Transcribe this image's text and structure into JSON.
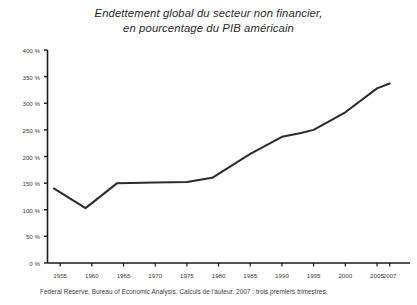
{
  "chart_data": {
    "type": "line",
    "title": "Endettement global du secteur non financier, en pourcentage du PIB américain",
    "title_lines": [
      "Endettement global du secteur non financier,",
      "en pourcentage du PIB américain"
    ],
    "xlabel": "",
    "ylabel": "",
    "xlim": [
      1953,
      2008
    ],
    "ylim": [
      0,
      400
    ],
    "grid": false,
    "legend": false,
    "line_color": "#2b2b2b",
    "axis_color": "#1a1a1a",
    "background_color": "#ffffff",
    "x_tick_labels": [
      "1955",
      "1960",
      "1965",
      "1970",
      "1975",
      "1980",
      "1985",
      "1990",
      "1995",
      "2000",
      "2005",
      "2007"
    ],
    "x_tick_values": [
      1955,
      1960,
      1965,
      1970,
      1975,
      1980,
      1985,
      1990,
      1995,
      2000,
      2005,
      2007
    ],
    "y_tick_labels": [
      "0 %",
      "50 %",
      "100 %",
      "150 %",
      "200 %",
      "250 %",
      "300 %",
      "350 %",
      "400 %"
    ],
    "y_tick_values": [
      0,
      50,
      100,
      150,
      200,
      250,
      300,
      350,
      400
    ],
    "series": [
      {
        "name": "Endettement global du secteur non financier (% du PIB)",
        "x": [
          1954,
          1959,
          1964,
          1970,
          1975,
          1979,
          1985,
          1990,
          1993,
          1995,
          2000,
          2005,
          2007
        ],
        "values": [
          140,
          103,
          150,
          151,
          152,
          160,
          205,
          237,
          244,
          250,
          283,
          328,
          337
        ]
      }
    ],
    "source": "Federal Reserve, Bureau of Economic Analysis. Calculs de l'auteur. 2007 : trois premiers trimestres."
  }
}
